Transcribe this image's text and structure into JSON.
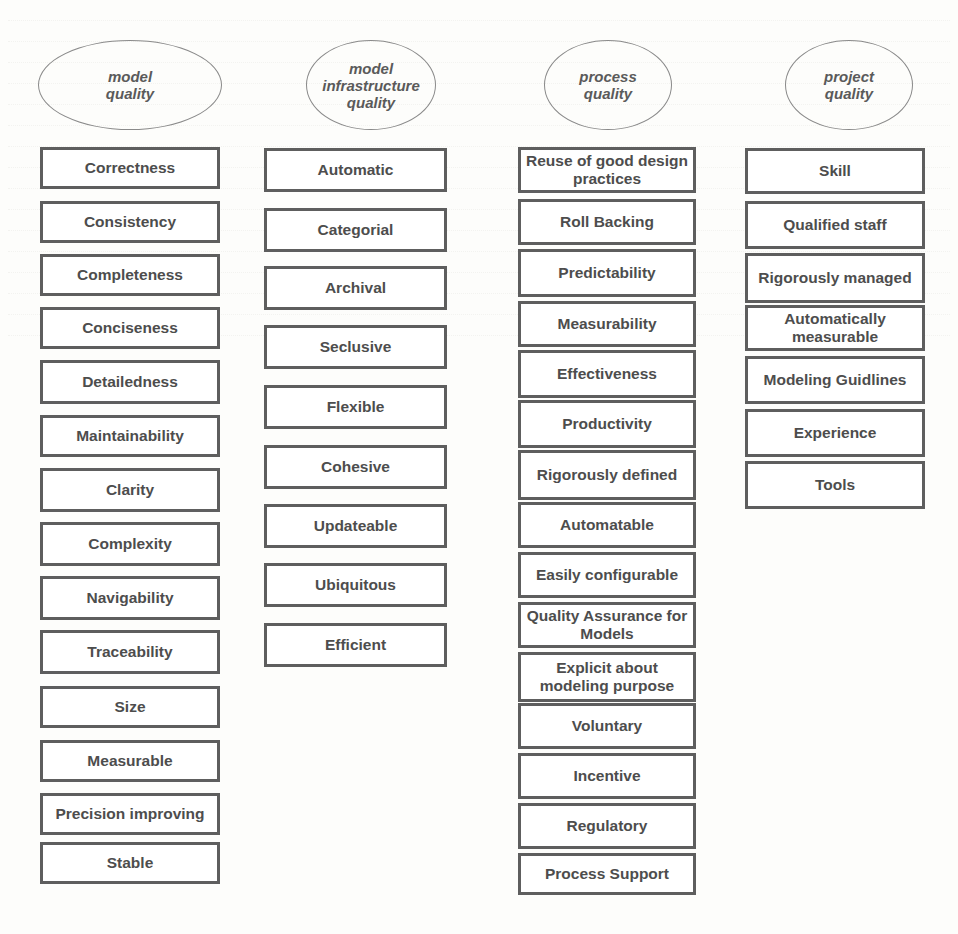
{
  "diagram": {
    "categories": [
      {
        "title": "model quality",
        "title_lines": [
          "model",
          "quality"
        ],
        "items": [
          "Correctness",
          "Consistency",
          "Completeness",
          "Conciseness",
          "Detailedness",
          "Maintainability",
          "Clarity",
          "Complexity",
          "Navigability",
          "Traceability",
          "Size",
          "Measurable",
          "Precision improving",
          "Stable"
        ]
      },
      {
        "title": "model infrastructure quality",
        "title_lines": [
          "model",
          "infrastructure",
          "quality"
        ],
        "items": [
          "Automatic",
          "Categorial",
          "Archival",
          "Seclusive",
          "Flexible",
          "Cohesive",
          "Updateable",
          "Ubiquitous",
          "Efficient"
        ]
      },
      {
        "title": "process quality",
        "title_lines": [
          "process",
          "quality"
        ],
        "items": [
          "Reuse of good design practices",
          "Roll Backing",
          "Predictability",
          "Measurability",
          "Effectiveness",
          "Productivity",
          "Rigorously defined",
          "Automatable",
          "Easily configurable",
          "Quality Assurance for Models",
          "Explicit about modeling purpose",
          "Voluntary",
          "Incentive",
          "Regulatory",
          "Process Support"
        ]
      },
      {
        "title": "project quality",
        "title_lines": [
          "project",
          "quality"
        ],
        "items": [
          "Skill",
          "Qualified staff",
          "Rigorously managed",
          "Automatically measurable",
          "Modeling Guidlines",
          "Experience",
          "Tools"
        ]
      }
    ]
  },
  "colors": {
    "box_border": "#5e5e5e",
    "text": "#4d4d4d",
    "oval_border": "#8a8a8a",
    "background": "#fdfdfb"
  }
}
